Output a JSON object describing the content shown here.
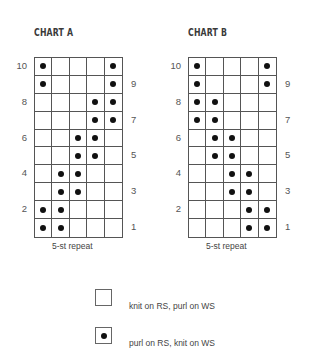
{
  "chart_data": [
    {
      "type": "table",
      "title": "CHART A",
      "caption": "5-st repeat",
      "columns": 5,
      "rows": 10,
      "row_labels_left": [
        10,
        8,
        6,
        4,
        2
      ],
      "row_labels_right": [
        9,
        7,
        5,
        3,
        1
      ],
      "purl_cells_by_row": {
        "10": [
          1,
          5
        ],
        "9": [
          1,
          5
        ],
        "8": [
          4,
          5
        ],
        "7": [
          4,
          5
        ],
        "6": [
          3,
          4
        ],
        "5": [
          3,
          4
        ],
        "4": [
          2,
          3
        ],
        "3": [
          2,
          3
        ],
        "2": [
          1,
          2
        ],
        "1": [
          1,
          2
        ]
      }
    },
    {
      "type": "table",
      "title": "CHART B",
      "caption": "5-st repeat",
      "columns": 5,
      "rows": 10,
      "row_labels_left": [
        10,
        8,
        6,
        4,
        2
      ],
      "row_labels_right": [
        9,
        7,
        5,
        3,
        1
      ],
      "purl_cells_by_row": {
        "10": [
          1,
          5
        ],
        "9": [
          1,
          5
        ],
        "8": [
          1,
          2
        ],
        "7": [
          1,
          2
        ],
        "6": [
          2,
          3
        ],
        "5": [
          2,
          3
        ],
        "4": [
          3,
          4
        ],
        "3": [
          3,
          4
        ],
        "2": [
          4,
          5
        ],
        "1": [
          4,
          5
        ]
      }
    }
  ],
  "legend": [
    {
      "symbol": "empty-square",
      "label": "knit on RS, purl on WS"
    },
    {
      "symbol": "dot-square",
      "label": "purl on RS, knit on WS"
    }
  ],
  "colors": {
    "grid_line": "#555555",
    "dot": "#111111",
    "text": "#444444"
  }
}
